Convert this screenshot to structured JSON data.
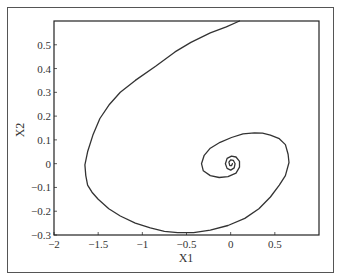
{
  "chart_data": {
    "type": "line",
    "title": "",
    "xlabel": "X1",
    "ylabel": "X2",
    "xlim": [
      -2,
      1
    ],
    "ylim": [
      -0.3,
      0.6
    ],
    "grid": false,
    "legend": null,
    "x_ticks": [
      -2,
      -1.5,
      -1,
      -0.5,
      0,
      0.5
    ],
    "x_tick_labels": [
      "-2",
      "-1.5",
      "-1",
      "-0.5",
      "0",
      "0.5"
    ],
    "y_ticks": [
      -0.3,
      -0.2,
      -0.1,
      0,
      0.1,
      0.2,
      0.3,
      0.4,
      0.5
    ],
    "y_tick_labels": [
      "-0.3",
      "-0.2",
      "-0.1",
      "0",
      "0.1",
      "0.2",
      "0.3",
      "0.4",
      "0.5"
    ],
    "series": [
      {
        "name": "phase trajectory",
        "description": "Spiral trajectory converging to a focus near (0, 0)",
        "x": [
          0.1,
          -0.05,
          -0.23,
          -0.45,
          -0.63,
          -0.85,
          -1.08,
          -1.25,
          -1.37,
          -1.48,
          -1.56,
          -1.62,
          -1.65,
          -1.64,
          -1.62,
          -1.57,
          -1.5,
          -1.38,
          -1.25,
          -1.08,
          -0.91,
          -0.75,
          -0.6,
          -0.42,
          -0.23,
          -0.03,
          0.16,
          0.32,
          0.45,
          0.55,
          0.62,
          0.66,
          0.65,
          0.62,
          0.55,
          0.45,
          0.36,
          0.27,
          0.14,
          0.01,
          -0.12,
          -0.23,
          -0.3,
          -0.33,
          -0.31,
          -0.23,
          -0.13,
          -0.03,
          0.06,
          0.1,
          0.1,
          0.06,
          0.01,
          -0.04,
          -0.06,
          -0.04,
          0.0,
          0.04,
          0.05,
          0.03,
          0.0,
          -0.02,
          -0.01,
          0.01,
          0.02
        ],
        "y": [
          0.6,
          0.575,
          0.55,
          0.51,
          0.47,
          0.41,
          0.35,
          0.3,
          0.25,
          0.19,
          0.12,
          0.05,
          -0.005,
          -0.05,
          -0.09,
          -0.12,
          -0.15,
          -0.19,
          -0.22,
          -0.25,
          -0.27,
          -0.285,
          -0.29,
          -0.29,
          -0.28,
          -0.26,
          -0.23,
          -0.19,
          -0.14,
          -0.09,
          -0.05,
          0.005,
          0.04,
          0.08,
          0.105,
          0.12,
          0.128,
          0.13,
          0.125,
          0.11,
          0.09,
          0.065,
          0.035,
          0.0,
          -0.03,
          -0.05,
          -0.058,
          -0.055,
          -0.04,
          -0.015,
          0.01,
          0.028,
          0.032,
          0.022,
          0.0,
          -0.02,
          -0.027,
          -0.018,
          0.0,
          0.014,
          0.016,
          0.006,
          -0.008,
          -0.008,
          0.0
        ]
      }
    ],
    "colors": {
      "line": "#333333",
      "axes": "#222222",
      "frame": "#555555",
      "background": "#ffffff"
    }
  }
}
